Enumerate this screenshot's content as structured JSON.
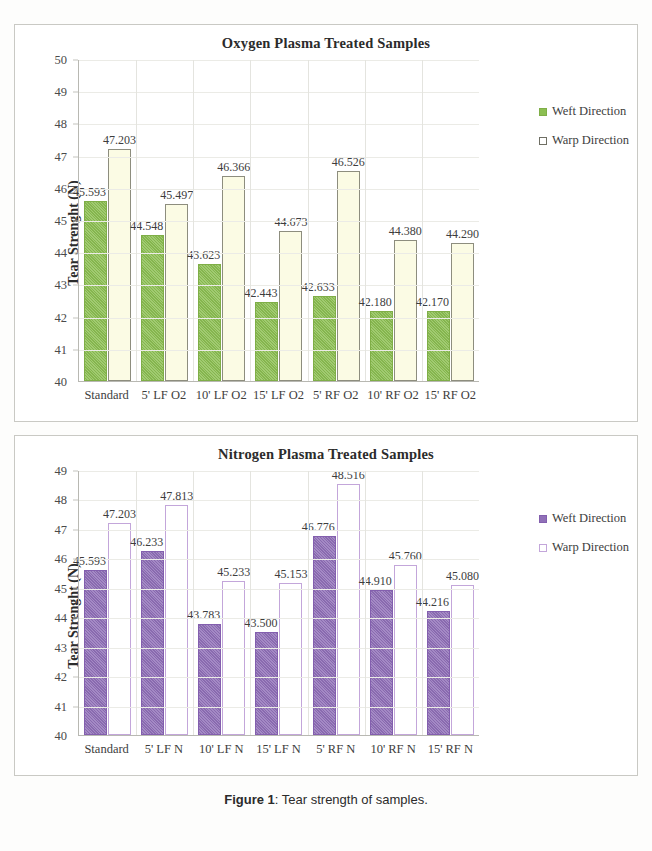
{
  "caption": {
    "label": "Figure 1",
    "separator": ": ",
    "text": "Tear strength of samples."
  },
  "colors": {
    "weft_green": "#8cbf52",
    "warp_green_fill": "#fbfbe4",
    "warp_green_border": "#8d8d7e",
    "weft_purple": "#9070b8",
    "warp_purple_border": "#c3a6da",
    "axis": "#b8b8b2",
    "frame": "#c9c9c4"
  },
  "chart_data": [
    {
      "type": "bar",
      "title": "Oxygen Plasma Treated Samples",
      "xlabel": "",
      "ylabel": "Tear Strenght (N)",
      "ylim": [
        40,
        50
      ],
      "ytick_step": 1,
      "yticks": [
        "50",
        "49",
        "48",
        "47",
        "46",
        "45",
        "44",
        "43",
        "42",
        "41",
        "40"
      ],
      "grid": true,
      "legend_position": "right",
      "categories": [
        "Standard",
        "5' LF O2",
        "10' LF O2",
        "15' LF O2",
        "5' RF O2",
        "10' RF O2",
        "15' RF O2"
      ],
      "series": [
        {
          "name": "Weft Direction",
          "values": [
            45.593,
            44.548,
            43.623,
            42.443,
            42.633,
            42.18,
            42.17
          ],
          "labels": [
            "45.593",
            "44.548",
            "43.623",
            "42.443",
            "42.633",
            "42.180",
            "42.170"
          ]
        },
        {
          "name": "Warp Direction",
          "values": [
            47.203,
            45.497,
            46.366,
            44.673,
            46.526,
            44.38,
            44.29
          ],
          "labels": [
            "47.203",
            "45.497",
            "46.366",
            "44.673",
            "46.526",
            "44.380",
            "44.290"
          ]
        }
      ]
    },
    {
      "type": "bar",
      "title": "Nitrogen Plasma Treated Samples",
      "xlabel": "",
      "ylabel": "Tear Strenght (N)",
      "ylim": [
        40,
        49
      ],
      "ytick_step": 1,
      "yticks": [
        "49",
        "48",
        "47",
        "46",
        "45",
        "44",
        "43",
        "42",
        "41",
        "40"
      ],
      "grid": true,
      "legend_position": "right",
      "categories": [
        "Standard",
        "5' LF N",
        "10' LF N",
        "15' LF N",
        "5' RF N",
        "10' RF N",
        "15' RF N"
      ],
      "series": [
        {
          "name": "Weft Direction",
          "values": [
            45.593,
            46.233,
            43.783,
            43.5,
            46.776,
            44.91,
            44.216
          ],
          "labels": [
            "45.593",
            "46.233",
            "43.783",
            "43.500",
            "46.776",
            "44.910",
            "44.216"
          ]
        },
        {
          "name": "Warp Direction",
          "values": [
            47.203,
            47.813,
            45.233,
            45.153,
            48.516,
            45.76,
            45.08
          ],
          "labels": [
            "47.203",
            "47.813",
            "45.233",
            "45.153",
            "48.516",
            "45.760",
            "45.080"
          ]
        }
      ]
    }
  ]
}
